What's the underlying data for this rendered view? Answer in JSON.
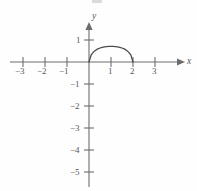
{
  "figure": {
    "kind": "cartesian-graph",
    "axis_color": "#6b6c70",
    "curve_color": "#4a4b50",
    "background": "#fefefe"
  },
  "axes": {
    "x_name": "x",
    "y_name": "y",
    "origin_px": [
      89,
      62
    ],
    "unit_px": 22,
    "x_range": [
      -3.6,
      3.9
    ],
    "y_range": [
      -5.6,
      1.6
    ]
  },
  "x_ticks": [
    {
      "value": -3,
      "label": "−3"
    },
    {
      "value": -2,
      "label": "−2"
    },
    {
      "value": -1,
      "label": "−1"
    },
    {
      "value": 1,
      "label": "1"
    },
    {
      "value": 2,
      "label": "2"
    },
    {
      "value": 3,
      "label": "3"
    }
  ],
  "y_ticks": [
    {
      "value": 1,
      "label": "1"
    },
    {
      "value": -1,
      "label": "−1"
    },
    {
      "value": -2,
      "label": "−2"
    },
    {
      "value": -3,
      "label": "−3"
    },
    {
      "value": -4,
      "label": "−4"
    },
    {
      "value": -5,
      "label": "−5"
    }
  ],
  "chart_data": {
    "type": "line",
    "title": "",
    "xlabel": "x",
    "ylabel": "y",
    "xlim": [
      -3.6,
      3.9
    ],
    "ylim": [
      -5.6,
      1.6
    ],
    "grid": false,
    "legend": "none",
    "xticks": [
      -3,
      -2,
      -1,
      1,
      2,
      3
    ],
    "yticks": [
      1,
      -1,
      -2,
      -3,
      -4,
      -5
    ],
    "series": [
      {
        "name": "arc",
        "domain": [
          0,
          2
        ],
        "x": [
          0.0,
          0.1,
          0.2,
          0.3,
          0.4,
          0.5,
          0.6,
          0.7,
          0.8,
          0.9,
          1.0,
          1.1,
          1.2,
          1.3,
          1.4,
          1.5,
          1.6,
          1.7,
          1.8,
          1.9,
          2.0
        ],
        "y": [
          0.0,
          0.327,
          0.45,
          0.534,
          0.594,
          0.637,
          0.667,
          0.687,
          0.7,
          0.707,
          0.708,
          0.707,
          0.7,
          0.687,
          0.667,
          0.637,
          0.594,
          0.534,
          0.45,
          0.327,
          0.0
        ],
        "peak": {
          "x": 1,
          "y": 0.71
        },
        "endpoints": [
          {
            "x": 0,
            "y": 0
          },
          {
            "x": 2,
            "y": 0
          }
        ]
      }
    ]
  }
}
